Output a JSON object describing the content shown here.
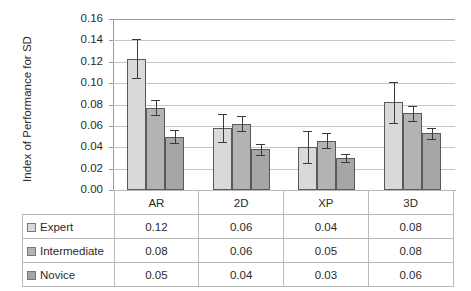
{
  "chart_data": {
    "type": "bar",
    "title": "",
    "subtitle": "",
    "xlabel": "",
    "ylabel": "Index of Performance for SD",
    "ylim": [
      0.0,
      0.16
    ],
    "ytick_step": 0.02,
    "ytick_labels": [
      "0.16",
      "0.14",
      "0.12",
      "0.10",
      "0.08",
      "0.06",
      "0.04",
      "0.02",
      "0.00"
    ],
    "ytick_values": [
      0.16,
      0.14,
      0.12,
      0.1,
      0.08,
      0.06,
      0.04,
      0.02,
      0.0
    ],
    "grid": true,
    "grid_axis": "y",
    "legend_position": "data-table-row-headers",
    "categories": [
      "AR",
      "2D",
      "XP",
      "3D"
    ],
    "series": [
      {
        "name": "Expert",
        "color": "#d9d9d9",
        "edge_color": "#595959",
        "values": [
          0.123,
          0.058,
          0.04,
          0.082
        ],
        "errors": [
          0.018,
          0.013,
          0.015,
          0.019
        ],
        "table_values": [
          "0.12",
          "0.06",
          "0.04",
          "0.08"
        ]
      },
      {
        "name": "Intermediate",
        "color": "#b3b3b3",
        "edge_color": "#595959",
        "values": [
          0.077,
          0.062,
          0.046,
          0.072
        ],
        "errors": [
          0.007,
          0.007,
          0.007,
          0.007
        ],
        "table_values": [
          "0.08",
          "0.06",
          "0.05",
          "0.08"
        ]
      },
      {
        "name": "Novice",
        "color": "#a6a6a6",
        "edge_color": "#595959",
        "values": [
          0.05,
          0.038,
          0.03,
          0.053
        ],
        "errors": [
          0.006,
          0.005,
          0.004,
          0.005
        ],
        "table_values": [
          "0.05",
          "0.04",
          "0.03",
          "0.06"
        ]
      }
    ],
    "data_table": {
      "header_row": [
        "",
        "AR",
        "2D",
        "XP",
        "3D"
      ],
      "rows": [
        {
          "label": "Expert",
          "swatch": "#d9d9d9",
          "cells": [
            "0.12",
            "0.06",
            "0.04",
            "0.08"
          ]
        },
        {
          "label": "Intermediate",
          "swatch": "#b3b3b3",
          "cells": [
            "0.08",
            "0.06",
            "0.05",
            "0.08"
          ]
        },
        {
          "label": "Novice",
          "swatch": "#a6a6a6",
          "cells": [
            "0.05",
            "0.04",
            "0.03",
            "0.06"
          ]
        }
      ]
    }
  }
}
